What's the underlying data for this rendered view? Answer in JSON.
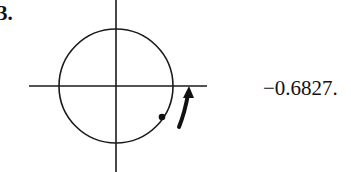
{
  "problem": {
    "number_label": "3."
  },
  "answer": {
    "text": "−0.6827."
  },
  "diagram": {
    "type": "unit-circle",
    "elements": [
      "horizontal-axis",
      "vertical-axis",
      "circle",
      "point",
      "counterclockwise-arrow"
    ],
    "colors": {
      "stroke": "#1a1a1a"
    }
  }
}
